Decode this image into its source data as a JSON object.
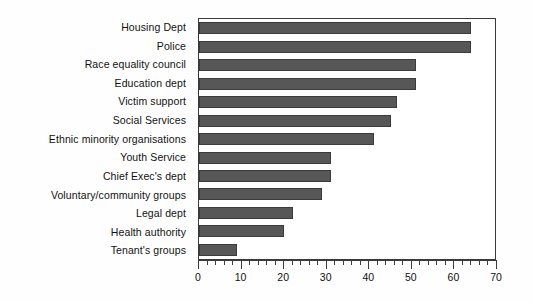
{
  "chart_data": {
    "type": "bar",
    "orientation": "horizontal",
    "title": "",
    "subtitle": "",
    "xlabel": "",
    "ylabel": "",
    "xlim": [
      0,
      70
    ],
    "x_major_ticks": [
      0,
      10,
      20,
      30,
      40,
      50,
      60,
      70
    ],
    "x_tick_labels": [
      "0",
      "10",
      "20",
      "30",
      "40",
      "50",
      "60",
      "70"
    ],
    "x_minor_tick_step": 2,
    "grid": false,
    "legend": null,
    "bar_color": "#575757",
    "bar_edge_color": "#3b3b3b",
    "axis_color": "#3a3a3a",
    "background": "#ffffff",
    "categories": [
      "Housing Dept",
      "Police",
      "Race equality council",
      "Education dept",
      "Victim support",
      "Social Services",
      "Ethnic minority organisations",
      "Youth Service",
      "Chief Exec's dept",
      "Voluntary/community groups",
      "Legal dept",
      "Health authority",
      "Tenant's groups"
    ],
    "values": [
      64,
      64,
      51,
      51,
      46.5,
      45,
      41,
      31,
      31,
      29,
      22,
      20,
      9
    ]
  }
}
